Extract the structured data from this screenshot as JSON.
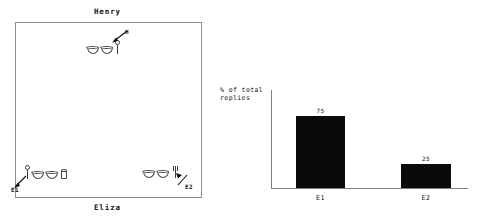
{
  "scene": {
    "top_label": "Henry",
    "bottom_label": "Eliza",
    "groups": [
      {
        "id": "henry",
        "annotation_label": "H",
        "objects": [
          "bowl",
          "bowl",
          "person"
        ]
      },
      {
        "id": "eliza-left",
        "annotation_label": "E1",
        "objects": [
          "person",
          "bowl",
          "bowl",
          "cup"
        ]
      },
      {
        "id": "eliza-right",
        "annotation_label": "E2",
        "objects": [
          "bowl",
          "bowl",
          "fork"
        ]
      }
    ]
  },
  "chart_data": {
    "type": "bar",
    "title": "",
    "xlabel": "",
    "ylabel": "% of total\nreplies",
    "categories": [
      "E1",
      "E2"
    ],
    "values": [
      75,
      25
    ],
    "value_labels": [
      "75",
      "25"
    ],
    "ylim": [
      0,
      100
    ],
    "grid": false,
    "legend": "none",
    "bar_color": "#0a0a0a",
    "axis_color": "#808080"
  }
}
